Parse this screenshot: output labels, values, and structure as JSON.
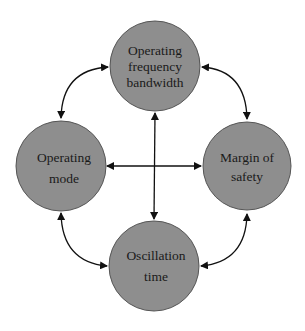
{
  "diagram": {
    "type": "cycle-relationship",
    "node_fill": "#8e8e8e",
    "node_stroke": "#555555",
    "edge_color": "#111111",
    "nodes": [
      {
        "id": "top",
        "lines": [
          "Operating",
          "frequency",
          "bandwidth"
        ],
        "cx": 155,
        "cy": 66,
        "r": 45
      },
      {
        "id": "left",
        "lines": [
          "Operating",
          "mode"
        ],
        "cx": 61,
        "cy": 166,
        "r": 45
      },
      {
        "id": "right",
        "lines": [
          "Margin of",
          "safety"
        ],
        "cx": 247,
        "cy": 166,
        "r": 44
      },
      {
        "id": "bottom",
        "lines": [
          "Oscillation",
          "time"
        ],
        "cx": 154,
        "cy": 266,
        "r": 45
      }
    ],
    "edges": [
      {
        "from": "top",
        "to": "left",
        "bidirectional": true
      },
      {
        "from": "top",
        "to": "right",
        "bidirectional": true
      },
      {
        "from": "bottom",
        "to": "left",
        "bidirectional": true
      },
      {
        "from": "bottom",
        "to": "right",
        "bidirectional": true
      },
      {
        "from": "left",
        "to": "right",
        "bidirectional": true
      },
      {
        "from": "top",
        "to": "bottom",
        "bidirectional": true
      }
    ]
  }
}
